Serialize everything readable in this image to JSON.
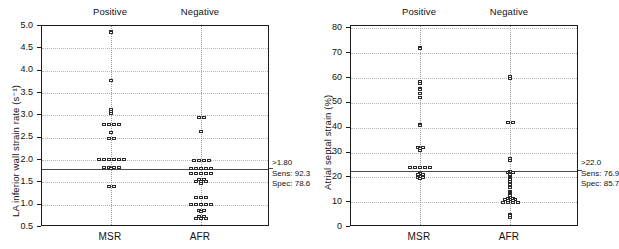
{
  "figure": {
    "panels": [
      {
        "id": "panel-left",
        "group_headers": [
          "Positive",
          "Negative"
        ],
        "x_categories": [
          "MSR",
          "AFR"
        ],
        "annotation": {
          "cutoff": ">1.80",
          "sensitivity": "Sens: 92.3",
          "specificity": "Spec: 78.6"
        },
        "chart_data": {
          "type": "scatter",
          "title": "",
          "xlabel": "",
          "ylabel": "LA inferior wall strain rate (s⁻¹)",
          "ylim": [
            0.5,
            5.0
          ],
          "yticks": [
            "5.0",
            "4.5",
            "4.0",
            "3.5",
            "3.0",
            "2.5",
            "2.0",
            "1.5",
            "1.0",
            "0.5"
          ],
          "ytick_values": [
            5.0,
            4.5,
            4.0,
            3.5,
            3.0,
            2.5,
            2.0,
            1.5,
            1.0,
            0.5
          ],
          "grid": true,
          "legend": "none",
          "cutoff_value": 1.8,
          "annotations": [
            ">1.80",
            "Sens: 92.3",
            "Spec: 78.6"
          ],
          "categories": [
            "MSR",
            "AFR"
          ],
          "series": [
            {
              "name": "MSR",
              "group": "Positive",
              "values": [
                4.88,
                4.85,
                3.78,
                3.12,
                3.08,
                3.05,
                2.8,
                2.8,
                2.8,
                2.8,
                2.62,
                2.49,
                2.47,
                2.02,
                2.02,
                2.02,
                2.02,
                2.02,
                2.02,
                1.84,
                1.84,
                1.82,
                1.82,
                1.8,
                1.4,
                1.4
              ]
            },
            {
              "name": "AFR",
              "group": "Negative",
              "values": [
                2.96,
                2.94,
                2.63,
                2.0,
                2.0,
                1.98,
                1.98,
                1.8,
                1.8,
                1.8,
                1.8,
                1.78,
                1.7,
                1.7,
                1.7,
                1.7,
                1.7,
                1.56,
                1.54,
                1.52,
                1.52,
                1.5,
                1.48,
                1.16,
                1.16,
                1.16,
                1.0,
                1.0,
                1.0,
                1.0,
                1.0,
                0.88,
                0.86,
                0.84,
                0.74,
                0.72,
                0.7,
                0.7,
                0.68
              ]
            }
          ]
        }
      },
      {
        "id": "panel-right",
        "group_headers": [
          "Positive",
          "Negative"
        ],
        "x_categories": [
          "MSR",
          "AFR"
        ],
        "annotation": {
          "cutoff": ">22.0",
          "sensitivity": "Sens: 76.9",
          "specificity": "Spec: 85.7"
        },
        "chart_data": {
          "type": "scatter",
          "title": "",
          "xlabel": "",
          "ylabel": "Atrial septal strain (%)",
          "ylim": [
            0,
            81
          ],
          "yticks": [
            "80",
            "70",
            "60",
            "50",
            "40",
            "30",
            "20",
            "10",
            "0"
          ],
          "ytick_values": [
            80,
            70,
            60,
            50,
            40,
            30,
            20,
            10,
            0
          ],
          "grid": true,
          "legend": "none",
          "cutoff_value": 22.5,
          "annotations": [
            ">22.0",
            "Sens: 76.9",
            "Spec: 85.7"
          ],
          "categories": [
            "MSR",
            "AFR"
          ],
          "series": [
            {
              "name": "MSR",
              "group": "Positive",
              "values": [
                72.5,
                72.0,
                58.5,
                58.0,
                56.0,
                55.5,
                54.0,
                52.0,
                41.5,
                41.0,
                32.0,
                32.0,
                31.5,
                31.0,
                24.0,
                24.0,
                24.0,
                24.0,
                24.0,
                21.5,
                21.0,
                21.0,
                20.5,
                20.0,
                20.0,
                19.5
              ]
            },
            {
              "name": "AFR",
              "group": "Negative",
              "values": [
                60.5,
                60.0,
                42.0,
                41.8,
                27.5,
                27.0,
                22.5,
                22.0,
                22.0,
                21.5,
                21.0,
                20.5,
                20.0,
                19.5,
                19.0,
                18.5,
                17.0,
                16.5,
                16.0,
                14.5,
                14.0,
                13.5,
                13.0,
                12.5,
                12.0,
                11.5,
                11.5,
                11.0,
                11.0,
                11.0,
                10.5,
                10.5,
                10.0,
                10.0,
                10.0,
                9.8,
                5.0,
                4.6,
                4.0
              ]
            }
          ]
        }
      }
    ]
  }
}
